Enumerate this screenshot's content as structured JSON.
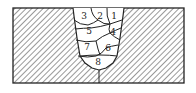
{
  "diagram": {
    "type": "multi-pass weld bead sequence cross-section",
    "colors": {
      "line": "#222222",
      "hatch": "#333333",
      "background": "#ffffff"
    },
    "passes": [
      {
        "label": "1",
        "x": 114,
        "y": 19
      },
      {
        "label": "2",
        "x": 100,
        "y": 19
      },
      {
        "label": "3",
        "x": 84,
        "y": 19
      },
      {
        "label": "4",
        "x": 113,
        "y": 35
      },
      {
        "label": "5",
        "x": 89,
        "y": 34
      },
      {
        "label": "6",
        "x": 108,
        "y": 51
      },
      {
        "label": "7",
        "x": 87,
        "y": 50
      },
      {
        "label": "8",
        "x": 98,
        "y": 65
      }
    ]
  }
}
